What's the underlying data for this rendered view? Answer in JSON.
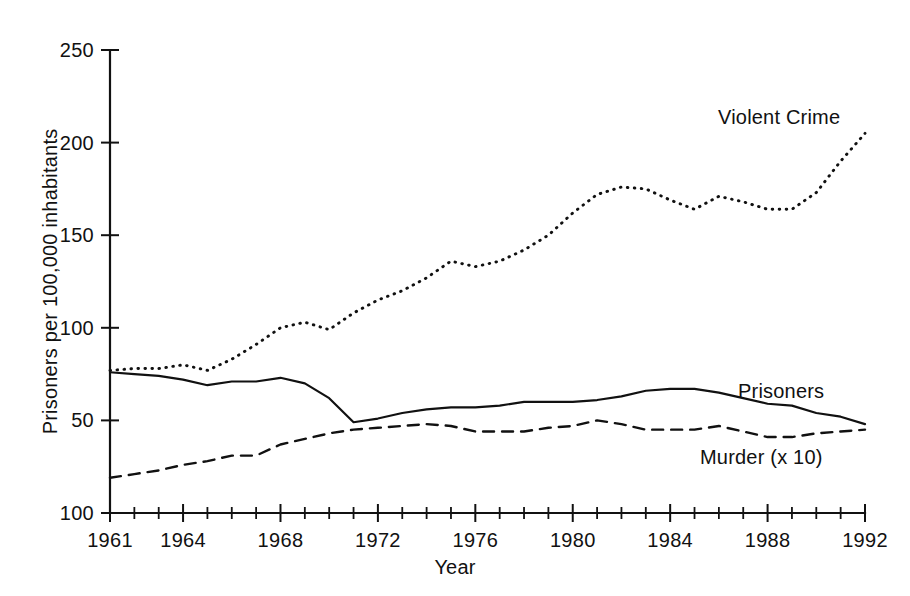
{
  "chart_data": {
    "type": "line",
    "title": "",
    "xlabel": "Year",
    "ylabel": "Prisoners per 100,000 inhabitants",
    "xlim": [
      1961,
      1992
    ],
    "ylim": [
      0,
      250
    ],
    "grid": false,
    "legend_position": "inline-annotations",
    "x": [
      1961,
      1962,
      1963,
      1964,
      1965,
      1966,
      1967,
      1968,
      1969,
      1970,
      1971,
      1972,
      1973,
      1974,
      1975,
      1976,
      1977,
      1978,
      1979,
      1980,
      1981,
      1982,
      1983,
      1984,
      1985,
      1986,
      1987,
      1988,
      1989,
      1990,
      1991,
      1992
    ],
    "ytick_values": [
      250,
      200,
      150,
      100,
      50,
      0
    ],
    "ytick_labels": [
      "250",
      "200",
      "150",
      "100",
      "50",
      "100"
    ],
    "xtick_values": [
      1961,
      1964,
      1968,
      1972,
      1976,
      1980,
      1984,
      1988,
      1992
    ],
    "xtick_labels": [
      "1961",
      "1964",
      "1968",
      "1972",
      "1976",
      "1980",
      "1984",
      "1988",
      "1992"
    ],
    "xtick_minor_every": 1,
    "series": [
      {
        "name": "Violent Crime",
        "style": "dotted",
        "annotation": "Violent Crime",
        "values": [
          77,
          78,
          78,
          80,
          77,
          83,
          91,
          100,
          103,
          99,
          108,
          115,
          120,
          127,
          136,
          133,
          136,
          142,
          150,
          162,
          172,
          176,
          175,
          169,
          164,
          171,
          168,
          164,
          164,
          173,
          190,
          205
        ]
      },
      {
        "name": "Prisoners",
        "style": "solid",
        "annotation": "Prisoners",
        "values": [
          76,
          75,
          74,
          72,
          69,
          71,
          71,
          73,
          70,
          62,
          49,
          51,
          54,
          56,
          57,
          57,
          58,
          60,
          60,
          60,
          61,
          63,
          66,
          67,
          67,
          65,
          62,
          59,
          58,
          54,
          52,
          48
        ]
      },
      {
        "name": "Murder (x 10)",
        "style": "dashed",
        "annotation": "Murder (x 10)",
        "values": [
          19,
          21,
          23,
          26,
          28,
          31,
          31,
          37,
          40,
          43,
          45,
          46,
          47,
          48,
          47,
          44,
          44,
          44,
          46,
          47,
          50,
          48,
          45,
          45,
          45,
          47,
          44,
          41,
          41,
          43,
          44,
          45
        ]
      }
    ]
  }
}
